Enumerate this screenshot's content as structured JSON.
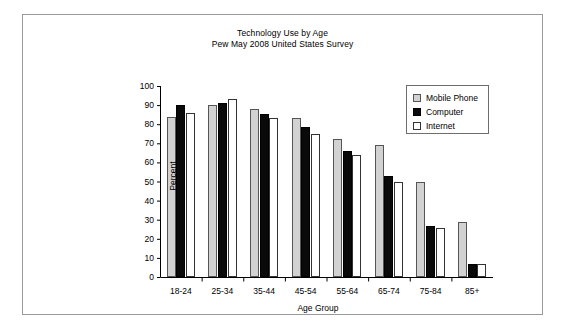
{
  "chart_data": {
    "type": "bar",
    "title": "Technology Use by Age",
    "subtitle": "Pew May 2008 United States Survey",
    "xlabel": "Age Group",
    "ylabel": "Percent",
    "ylim": [
      0,
      100
    ],
    "ytick_step": 10,
    "yticks": [
      0,
      10,
      20,
      30,
      40,
      50,
      60,
      70,
      80,
      90,
      100
    ],
    "grid": false,
    "legend_position": "top-right",
    "categories": [
      "18-24",
      "25-34",
      "35-44",
      "45-54",
      "55-64",
      "65-74",
      "75-84",
      "85+"
    ],
    "series": [
      {
        "name": "Mobile Phone",
        "color": "#d2d2d2",
        "values": [
          84,
          90,
          88,
          83,
          72,
          69,
          49.5,
          29
        ]
      },
      {
        "name": "Computer",
        "color": "#0a0a0a",
        "values": [
          90,
          91,
          85.5,
          78.5,
          66,
          53,
          26.5,
          7
        ]
      },
      {
        "name": "Internet",
        "color": "#ffffff",
        "values": [
          86,
          93,
          83,
          75,
          64,
          49.5,
          25.5,
          7
        ]
      }
    ]
  },
  "legend": {
    "items": [
      {
        "label": "Mobile Phone",
        "swatch": "mobile"
      },
      {
        "label": "Computer",
        "swatch": "computer"
      },
      {
        "label": "Internet",
        "swatch": "internet"
      }
    ]
  }
}
